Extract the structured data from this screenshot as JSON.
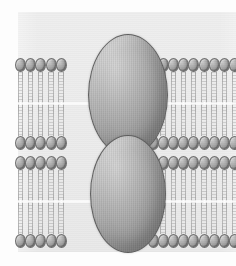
{
  "figure": {
    "alt": "Two parallel phospholipid bilayers, each spanned by a large oval transmembrane protein; the two proteins meet between the membranes",
    "background_color": "#ececec",
    "page_background": "#fdfdfd"
  },
  "colors": {
    "head_light": "#c9c9c9",
    "head_mid": "#a8a8a8",
    "head_dark": "#7d7d7d",
    "head_outline": "#6f6f6f",
    "tail_stroke": "#9a9a9a",
    "midline": "#ffffff",
    "protein_highlight": "#d2d2d2",
    "protein_mid": "#969696",
    "protein_shadow": "#737373",
    "protein_outline": "#5f5f5f"
  },
  "membranes": [
    {
      "name": "upper-membrane",
      "label": "Upper lipid bilayer",
      "top": 46,
      "outer_head_row_y": 0,
      "inner_head_row_y": 78,
      "head_count_left": 8,
      "head_count_right": 8,
      "tail_length": 32
    },
    {
      "name": "lower-membrane",
      "label": "Lower lipid bilayer",
      "top": 144,
      "outer_head_row_y": 0,
      "inner_head_row_y": 78,
      "head_count_left": 8,
      "head_count_right": 8,
      "tail_length": 32
    }
  ],
  "proteins": [
    {
      "name": "transmembrane-protein-upper",
      "label": "Transmembrane protein (upper membrane)",
      "x": 70,
      "y": 22,
      "width": 80,
      "height": 122
    },
    {
      "name": "transmembrane-protein-lower",
      "label": "Transmembrane protein (lower membrane)",
      "x": 72,
      "y": 123,
      "width": 76,
      "height": 118
    }
  ],
  "geometry": {
    "panel": {
      "left": 18,
      "top": 12,
      "width": 218,
      "height": 240
    },
    "head": {
      "width": 11,
      "height": 14,
      "pitch": 10.2
    },
    "protein_gap_left": 52,
    "protein_gap_right": 132
  }
}
